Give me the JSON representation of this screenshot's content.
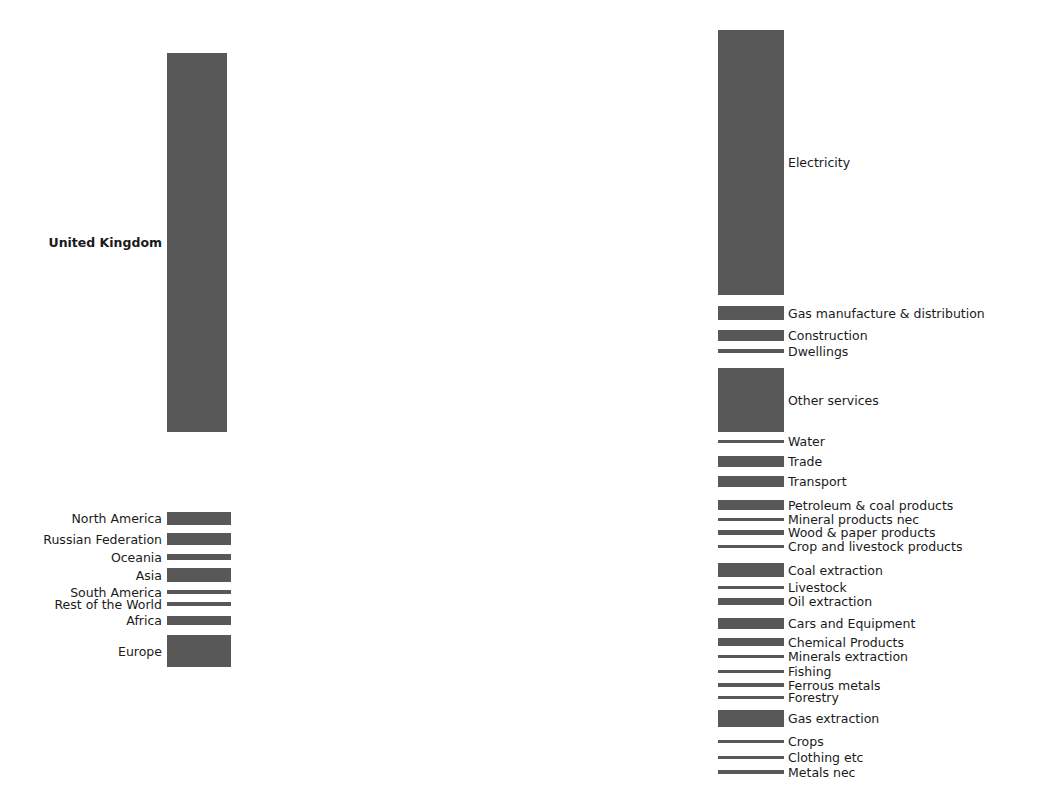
{
  "figure": {
    "kind": "sankey-diagram",
    "width": 1056,
    "height": 789,
    "background": "#ffffff",
    "node_color": "#585858",
    "link_color": "#c8c8c8",
    "label_color": "#1a1a1a"
  },
  "chart_data": {
    "type": "sankey",
    "title": "",
    "xlabel": "",
    "ylabel": "",
    "grid": false,
    "legend": "none",
    "nodes": [
      {
        "id": "united_kingdom",
        "label": "United Kingdom",
        "side": "left",
        "bold": true,
        "x": 167,
        "y": 53,
        "w": 60,
        "h": 379
      },
      {
        "id": "north_america",
        "label": "North America",
        "side": "left",
        "bold": false,
        "x": 167,
        "y": 512,
        "w": 64,
        "h": 13
      },
      {
        "id": "russian_federation",
        "label": "Russian Federation",
        "side": "left",
        "bold": false,
        "x": 167,
        "y": 533,
        "w": 64,
        "h": 12
      },
      {
        "id": "oceania",
        "label": "Oceania",
        "side": "left",
        "bold": false,
        "x": 167,
        "y": 554,
        "w": 64,
        "h": 6
      },
      {
        "id": "asia",
        "label": "Asia",
        "side": "left",
        "bold": false,
        "x": 167,
        "y": 568,
        "w": 64,
        "h": 14
      },
      {
        "id": "south_america",
        "label": "South America",
        "side": "left",
        "bold": false,
        "x": 167,
        "y": 590,
        "w": 64,
        "h": 4
      },
      {
        "id": "rest_of_the_world",
        "label": "Rest of the World",
        "side": "left",
        "bold": false,
        "x": 167,
        "y": 602,
        "w": 64,
        "h": 4
      },
      {
        "id": "africa",
        "label": "Africa",
        "side": "left",
        "bold": false,
        "x": 167,
        "y": 616,
        "w": 64,
        "h": 9
      },
      {
        "id": "europe",
        "label": "Europe",
        "side": "left",
        "bold": false,
        "x": 167,
        "y": 635,
        "w": 64,
        "h": 32
      },
      {
        "id": "electricity",
        "label": "Electricity",
        "side": "right",
        "bold": false,
        "x": 718,
        "y": 30,
        "w": 66,
        "h": 265
      },
      {
        "id": "gas_manufacture",
        "label": "Gas manufacture & distribution",
        "side": "right",
        "bold": false,
        "x": 718,
        "y": 306,
        "w": 66,
        "h": 14
      },
      {
        "id": "construction",
        "label": "Construction",
        "side": "right",
        "bold": false,
        "x": 718,
        "y": 330,
        "w": 66,
        "h": 11
      },
      {
        "id": "dwellings",
        "label": "Dwellings",
        "side": "right",
        "bold": false,
        "x": 718,
        "y": 349,
        "w": 66,
        "h": 4
      },
      {
        "id": "other_services",
        "label": "Other services",
        "side": "right",
        "bold": false,
        "x": 718,
        "y": 368,
        "w": 66,
        "h": 64
      },
      {
        "id": "water",
        "label": "Water",
        "side": "right",
        "bold": false,
        "x": 718,
        "y": 440,
        "w": 66,
        "h": 3
      },
      {
        "id": "trade",
        "label": "Trade",
        "side": "right",
        "bold": false,
        "x": 718,
        "y": 456,
        "w": 66,
        "h": 11
      },
      {
        "id": "transport",
        "label": "Transport",
        "side": "right",
        "bold": false,
        "x": 718,
        "y": 476,
        "w": 66,
        "h": 11
      },
      {
        "id": "petroleum_coal",
        "label": "Petroleum & coal products",
        "side": "right",
        "bold": false,
        "x": 718,
        "y": 500,
        "w": 66,
        "h": 10
      },
      {
        "id": "mineral_products_nec",
        "label": "Mineral products nec",
        "side": "right",
        "bold": false,
        "x": 718,
        "y": 518,
        "w": 66,
        "h": 3
      },
      {
        "id": "wood_paper",
        "label": "Wood & paper products",
        "side": "right",
        "bold": false,
        "x": 718,
        "y": 530,
        "w": 66,
        "h": 5
      },
      {
        "id": "crop_livestock",
        "label": "Crop and livestock products",
        "side": "right",
        "bold": false,
        "x": 718,
        "y": 545,
        "w": 66,
        "h": 3
      },
      {
        "id": "coal_extraction",
        "label": "Coal extraction",
        "side": "right",
        "bold": false,
        "x": 718,
        "y": 563,
        "w": 66,
        "h": 14
      },
      {
        "id": "livestock",
        "label": "Livestock",
        "side": "right",
        "bold": false,
        "x": 718,
        "y": 586,
        "w": 66,
        "h": 3
      },
      {
        "id": "oil_extraction",
        "label": "Oil extraction",
        "side": "right",
        "bold": false,
        "x": 718,
        "y": 598,
        "w": 66,
        "h": 7
      },
      {
        "id": "cars_equipment",
        "label": "Cars and Equipment",
        "side": "right",
        "bold": false,
        "x": 718,
        "y": 618,
        "w": 66,
        "h": 11
      },
      {
        "id": "chemical_products",
        "label": "Chemical Products",
        "side": "right",
        "bold": false,
        "x": 718,
        "y": 638,
        "w": 66,
        "h": 8
      },
      {
        "id": "minerals_extraction",
        "label": "Minerals extraction",
        "side": "right",
        "bold": false,
        "x": 718,
        "y": 655,
        "w": 66,
        "h": 3
      },
      {
        "id": "fishing",
        "label": "Fishing",
        "side": "right",
        "bold": false,
        "x": 718,
        "y": 670,
        "w": 66,
        "h": 3
      },
      {
        "id": "ferrous_metals",
        "label": "Ferrous metals",
        "side": "right",
        "bold": false,
        "x": 718,
        "y": 683,
        "w": 66,
        "h": 4
      },
      {
        "id": "forestry",
        "label": "Forestry",
        "side": "right",
        "bold": false,
        "x": 718,
        "y": 696,
        "w": 66,
        "h": 3
      },
      {
        "id": "gas_extraction",
        "label": "Gas extraction",
        "side": "right",
        "bold": false,
        "x": 718,
        "y": 710,
        "w": 66,
        "h": 17
      },
      {
        "id": "crops",
        "label": "Crops",
        "side": "right",
        "bold": false,
        "x": 718,
        "y": 740,
        "w": 66,
        "h": 3
      },
      {
        "id": "clothing_etc",
        "label": "Clothing etc",
        "side": "right",
        "bold": false,
        "x": 718,
        "y": 756,
        "w": 66,
        "h": 3
      },
      {
        "id": "metals_nec",
        "label": "Metals nec",
        "side": "right",
        "bold": false,
        "x": 718,
        "y": 770,
        "w": 66,
        "h": 4
      }
    ],
    "links": [
      {
        "source": "united_kingdom",
        "target": "electricity",
        "value": 262,
        "sy": 53,
        "ty": 30
      },
      {
        "source": "united_kingdom",
        "target": "gas_manufacture",
        "value": 11,
        "sy": 315,
        "ty": 306
      },
      {
        "source": "united_kingdom",
        "target": "construction",
        "value": 9,
        "sy": 326,
        "ty": 330
      },
      {
        "source": "united_kingdom",
        "target": "dwellings",
        "value": 4,
        "sy": 335,
        "ty": 349
      },
      {
        "source": "united_kingdom",
        "target": "other_services",
        "value": 52,
        "sy": 339,
        "ty": 368
      },
      {
        "source": "united_kingdom",
        "target": "water",
        "value": 2,
        "sy": 391,
        "ty": 440
      },
      {
        "source": "united_kingdom",
        "target": "trade",
        "value": 8,
        "sy": 393,
        "ty": 456
      },
      {
        "source": "united_kingdom",
        "target": "transport",
        "value": 7,
        "sy": 401,
        "ty": 476
      },
      {
        "source": "united_kingdom",
        "target": "petroleum_coal",
        "value": 5,
        "sy": 408,
        "ty": 500
      },
      {
        "source": "united_kingdom",
        "target": "mineral_products_nec",
        "value": 2,
        "sy": 413,
        "ty": 518
      },
      {
        "source": "united_kingdom",
        "target": "wood_paper",
        "value": 3,
        "sy": 415,
        "ty": 530
      },
      {
        "source": "united_kingdom",
        "target": "crop_livestock",
        "value": 2,
        "sy": 418,
        "ty": 545
      },
      {
        "source": "united_kingdom",
        "target": "coal_extraction",
        "value": 4,
        "sy": 420,
        "ty": 563
      },
      {
        "source": "united_kingdom",
        "target": "livestock",
        "value": 2,
        "sy": 424,
        "ty": 586
      },
      {
        "source": "united_kingdom",
        "target": "oil_extraction",
        "value": 3,
        "sy": 426,
        "ty": 598
      },
      {
        "source": "united_kingdom",
        "target": "cars_equipment",
        "value": 3,
        "sy": 429,
        "ty": 618
      },
      {
        "source": "north_america",
        "target": "electricity",
        "value": 1,
        "sy": 512,
        "ty": 295
      },
      {
        "source": "north_america",
        "target": "gas_manufacture",
        "value": 1,
        "sy": 513,
        "ty": 317
      },
      {
        "source": "north_america",
        "target": "other_services",
        "value": 3,
        "sy": 514,
        "ty": 420
      },
      {
        "source": "north_america",
        "target": "transport",
        "value": 1,
        "sy": 517,
        "ty": 484
      },
      {
        "source": "north_america",
        "target": "petroleum_coal",
        "value": 1,
        "sy": 518,
        "ty": 507
      },
      {
        "source": "north_america",
        "target": "coal_extraction",
        "value": 2,
        "sy": 519,
        "ty": 572
      },
      {
        "source": "north_america",
        "target": "cars_equipment",
        "value": 2,
        "sy": 521,
        "ty": 625
      },
      {
        "source": "north_america",
        "target": "chemical_products",
        "value": 1,
        "sy": 523,
        "ty": 643
      },
      {
        "source": "north_america",
        "target": "gas_extraction",
        "value": 1,
        "sy": 524,
        "ty": 723
      },
      {
        "source": "russian_federation",
        "target": "gas_extraction",
        "value": 6,
        "sy": 533,
        "ty": 710
      },
      {
        "source": "russian_federation",
        "target": "oil_extraction",
        "value": 2,
        "sy": 539,
        "ty": 598
      },
      {
        "source": "russian_federation",
        "target": "coal_extraction",
        "value": 2,
        "sy": 541,
        "ty": 563
      },
      {
        "source": "russian_federation",
        "target": "metals_nec",
        "value": 1,
        "sy": 543,
        "ty": 770
      },
      {
        "source": "russian_federation",
        "target": "ferrous_metals",
        "value": 1,
        "sy": 544,
        "ty": 683
      },
      {
        "source": "oceania",
        "target": "coal_extraction",
        "value": 2,
        "sy": 554,
        "ty": 575
      },
      {
        "source": "oceania",
        "target": "minerals_extraction",
        "value": 1,
        "sy": 556,
        "ty": 655
      },
      {
        "source": "oceania",
        "target": "crop_livestock",
        "value": 1,
        "sy": 557,
        "ty": 547
      },
      {
        "source": "oceania",
        "target": "other_services",
        "value": 2,
        "sy": 558,
        "ty": 428
      },
      {
        "source": "asia",
        "target": "electricity",
        "value": 2,
        "sy": 568,
        "ty": 290
      },
      {
        "source": "asia",
        "target": "cars_equipment",
        "value": 3,
        "sy": 570,
        "ty": 622
      },
      {
        "source": "asia",
        "target": "clothing_etc",
        "value": 2,
        "sy": 573,
        "ty": 756
      },
      {
        "source": "asia",
        "target": "chemical_products",
        "value": 2,
        "sy": 575,
        "ty": 640
      },
      {
        "source": "asia",
        "target": "other_services",
        "value": 3,
        "sy": 577,
        "ty": 424
      },
      {
        "source": "asia",
        "target": "metals_nec",
        "value": 2,
        "sy": 580,
        "ty": 772
      },
      {
        "source": "south_america",
        "target": "crop_livestock",
        "value": 1,
        "sy": 590,
        "ty": 546
      },
      {
        "source": "south_america",
        "target": "ferrous_metals",
        "value": 1,
        "sy": 591,
        "ty": 685
      },
      {
        "source": "south_america",
        "target": "other_services",
        "value": 1,
        "sy": 592,
        "ty": 430
      },
      {
        "source": "south_america",
        "target": "crops",
        "value": 1,
        "sy": 593,
        "ty": 740
      },
      {
        "source": "rest_of_the_world",
        "target": "other_services",
        "value": 1,
        "sy": 602,
        "ty": 431
      },
      {
        "source": "rest_of_the_world",
        "target": "oil_extraction",
        "value": 1,
        "sy": 603,
        "ty": 603
      },
      {
        "source": "rest_of_the_world",
        "target": "gas_extraction",
        "value": 1,
        "sy": 604,
        "ty": 725
      },
      {
        "source": "rest_of_the_world",
        "target": "fishing",
        "value": 1,
        "sy": 605,
        "ty": 670
      },
      {
        "source": "africa",
        "target": "oil_extraction",
        "value": 3,
        "sy": 616,
        "ty": 600
      },
      {
        "source": "africa",
        "target": "minerals_extraction",
        "value": 2,
        "sy": 619,
        "ty": 656
      },
      {
        "source": "africa",
        "target": "other_services",
        "value": 2,
        "sy": 621,
        "ty": 426
      },
      {
        "source": "africa",
        "target": "crops",
        "value": 2,
        "sy": 623,
        "ty": 742
      },
      {
        "source": "europe",
        "target": "electricity",
        "value": 2,
        "sy": 635,
        "ty": 285
      },
      {
        "source": "europe",
        "target": "gas_manufacture",
        "value": 2,
        "sy": 637,
        "ty": 319
      },
      {
        "source": "europe",
        "target": "construction",
        "value": 2,
        "sy": 639,
        "ty": 338
      },
      {
        "source": "europe",
        "target": "other_services",
        "value": 6,
        "sy": 641,
        "ty": 410
      },
      {
        "source": "europe",
        "target": "trade",
        "value": 3,
        "sy": 647,
        "ty": 464
      },
      {
        "source": "europe",
        "target": "transport",
        "value": 3,
        "sy": 650,
        "ty": 481
      },
      {
        "source": "europe",
        "target": "petroleum_coal",
        "value": 3,
        "sy": 653,
        "ty": 504
      },
      {
        "source": "europe",
        "target": "wood_paper",
        "value": 2,
        "sy": 656,
        "ty": 533
      },
      {
        "source": "europe",
        "target": "chemical_products",
        "value": 3,
        "sy": 658,
        "ty": 644
      },
      {
        "source": "europe",
        "target": "cars_equipment",
        "value": 3,
        "sy": 661,
        "ty": 627
      },
      {
        "source": "europe",
        "target": "gas_extraction",
        "value": 3,
        "sy": 664,
        "ty": 719
      }
    ]
  }
}
